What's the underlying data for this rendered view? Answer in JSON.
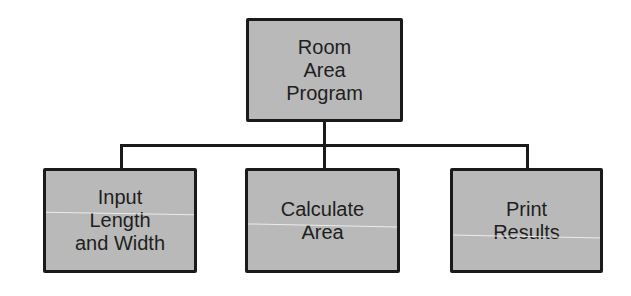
{
  "diagram": {
    "type": "hierarchy-chart",
    "root": {
      "id": "room-area-program",
      "lines": [
        "Room",
        "Area",
        "Program"
      ]
    },
    "children": [
      {
        "id": "input-length-width",
        "lines": [
          "Input",
          "Length",
          "and Width"
        ]
      },
      {
        "id": "calculate-area",
        "lines": [
          "Calculate",
          "Area"
        ]
      },
      {
        "id": "print-results",
        "lines": [
          "Print",
          "Results"
        ]
      }
    ],
    "colors": {
      "box_fill": "#b9b9b9",
      "box_border": "#1a1a1a",
      "text": "#1e1e1e",
      "connector": "#1a1a1a",
      "background": "#ffffff"
    }
  }
}
